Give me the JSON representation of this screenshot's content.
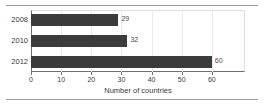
{
  "chart_data": {
    "type": "bar",
    "orientation": "horizontal",
    "title": "",
    "subtitle": "",
    "categories": [
      "2008",
      "2010",
      "2012"
    ],
    "values": [
      29,
      32,
      60
    ],
    "data_labels": [
      "29",
      "32",
      "60"
    ],
    "series": [
      {
        "name": "Number of countries",
        "values": [
          29,
          32,
          60
        ]
      }
    ],
    "xlabel": "Number of countries",
    "ylabel": "",
    "xlim": [
      0,
      71
    ],
    "xticks": [
      0,
      10,
      20,
      30,
      40,
      50,
      60
    ],
    "xtick_labels": [
      "0",
      "10",
      "20",
      "30",
      "40",
      "50",
      "60"
    ],
    "grid": "vertical-light",
    "legend": "none",
    "bar_color": "#3b3b3b",
    "axis_color": "#6f6f6f",
    "gridline_color": "#e9e9e9",
    "text_color": "#3a3a3a",
    "rules": {
      "top": true,
      "bottom": true,
      "color": "#9a9a9a"
    }
  }
}
